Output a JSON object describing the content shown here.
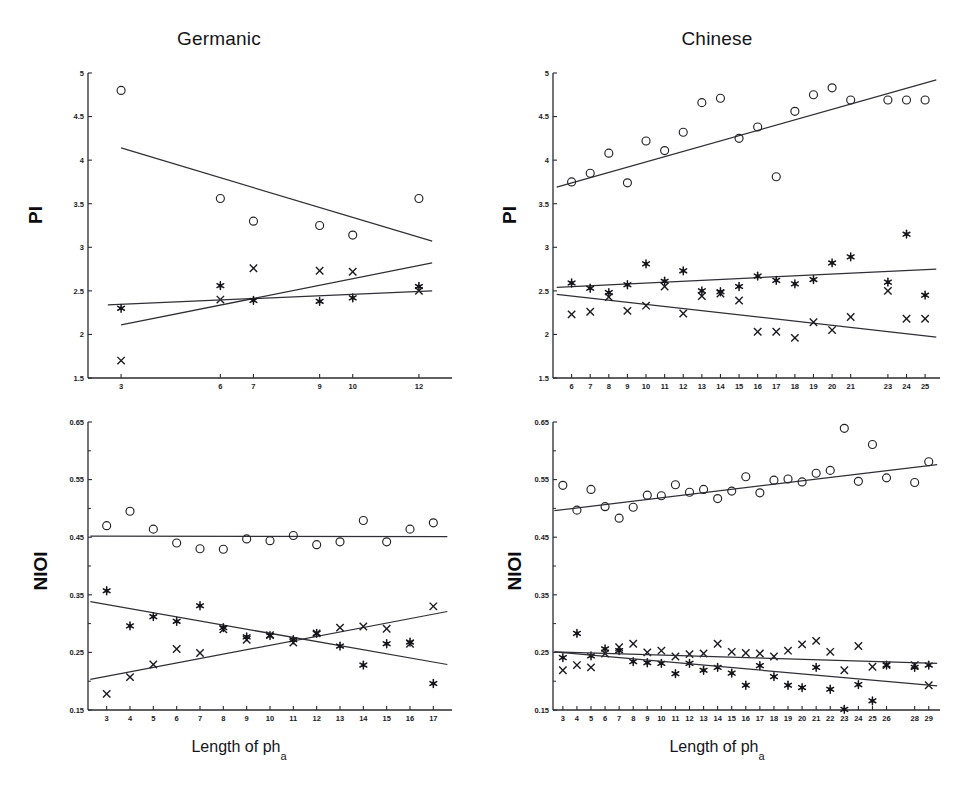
{
  "figure": {
    "xlabel_main": "Length of ph",
    "xlabel_sub": "a"
  },
  "panels": {
    "germanic_pi": {
      "title": "Germanic",
      "ylabel": "PI"
    },
    "chinese_pi": {
      "title": "Chinese",
      "ylabel": "PI"
    },
    "germanic_nioi": {
      "title": "",
      "ylabel": "NIOI"
    },
    "chinese_nioi": {
      "title": "",
      "ylabel": "NIOI"
    }
  },
  "chart_data": [
    {
      "id": "germanic_pi",
      "type": "scatter",
      "title": "Germanic",
      "xlabel": "Length of ph_a",
      "ylabel": "PI",
      "xlim": [
        2.0,
        13.0
      ],
      "ylim": [
        1.5,
        5.0
      ],
      "yticks": [
        1.5,
        2,
        2.5,
        3,
        3.5,
        4,
        4.5,
        5
      ],
      "ytick_labels": [
        "1.5",
        "2",
        "2.5",
        "3",
        "3.5",
        "4",
        "4.5",
        "5"
      ],
      "xticks": [
        3,
        6,
        7,
        9,
        10,
        12
      ],
      "xtick_labels": [
        "3",
        "6",
        "7",
        "9",
        "10",
        "12"
      ],
      "grid": false,
      "legend": "none",
      "series": [
        {
          "name": "circle",
          "marker": "open-circle",
          "x": [
            3,
            6,
            7,
            9,
            10,
            12
          ],
          "values": [
            4.8,
            3.56,
            3.3,
            3.25,
            3.14,
            3.56
          ],
          "fit": {
            "x": [
              3.0,
              12.4
            ],
            "y": [
              4.14,
              3.07
            ]
          }
        },
        {
          "name": "cross",
          "marker": "x-cross",
          "x": [
            3,
            6,
            7,
            9,
            10,
            12
          ],
          "values": [
            1.7,
            2.4,
            2.76,
            2.73,
            2.72,
            2.5
          ],
          "fit": {
            "x": [
              3.0,
              12.4
            ],
            "y": [
              2.11,
              2.82
            ]
          }
        },
        {
          "name": "asterisk",
          "marker": "filled-asterisk",
          "x": [
            3,
            6,
            7,
            9,
            10,
            12
          ],
          "values": [
            2.3,
            2.56,
            2.39,
            2.38,
            2.42,
            2.55
          ],
          "fit": {
            "x": [
              2.6,
              12.4
            ],
            "y": [
              2.34,
              2.5
            ]
          }
        }
      ]
    },
    {
      "id": "chinese_pi",
      "type": "scatter",
      "title": "Chinese",
      "xlabel": "Length of ph_a",
      "ylabel": "PI",
      "xlim": [
        5.0,
        25.8
      ],
      "ylim": [
        1.5,
        5.0
      ],
      "yticks": [
        1.5,
        2,
        2.5,
        3,
        3.5,
        4,
        4.5,
        5
      ],
      "ytick_labels": [
        "1.5",
        "2",
        "2.5",
        "3",
        "3.5",
        "4",
        "4.5",
        "5"
      ],
      "xticks": [
        6,
        7,
        8,
        9,
        10,
        11,
        12,
        13,
        14,
        15,
        16,
        17,
        18,
        19,
        20,
        21,
        23,
        24,
        25
      ],
      "xtick_labels": [
        "6",
        "7",
        "8",
        "9",
        "10",
        "11",
        "12",
        "13",
        "14",
        "15",
        "16",
        "17",
        "18",
        "19",
        "20",
        "21",
        "23",
        "24",
        "25"
      ],
      "grid": false,
      "legend": "none",
      "series": [
        {
          "name": "circle",
          "marker": "open-circle",
          "x": [
            6,
            7,
            8,
            9,
            10,
            11,
            12,
            13,
            14,
            15,
            16,
            17,
            18,
            19,
            20,
            21,
            23,
            24,
            25
          ],
          "values": [
            3.75,
            3.85,
            4.08,
            3.74,
            4.22,
            4.11,
            4.32,
            4.66,
            4.71,
            4.25,
            4.38,
            3.81,
            4.56,
            4.75,
            4.83,
            4.69,
            4.69,
            4.69,
            4.69
          ],
          "fit": {
            "x": [
              5.2,
              25.6
            ],
            "y": [
              3.69,
              4.92
            ]
          }
        },
        {
          "name": "cross",
          "marker": "x-cross",
          "x": [
            6,
            7,
            8,
            9,
            10,
            11,
            12,
            13,
            14,
            15,
            16,
            17,
            18,
            19,
            20,
            21,
            23,
            24,
            25
          ],
          "values": [
            2.23,
            2.26,
            2.43,
            2.27,
            2.33,
            2.55,
            2.24,
            2.44,
            2.47,
            2.39,
            2.03,
            2.03,
            1.96,
            2.14,
            2.05,
            2.2,
            2.5,
            2.18,
            2.18
          ],
          "fit": {
            "x": [
              5.2,
              25.6
            ],
            "y": [
              2.46,
              1.97
            ]
          }
        },
        {
          "name": "asterisk",
          "marker": "filled-asterisk",
          "x": [
            6,
            7,
            8,
            9,
            10,
            11,
            12,
            13,
            14,
            15,
            16,
            17,
            18,
            19,
            20,
            21,
            23,
            24,
            25
          ],
          "values": [
            2.59,
            2.53,
            2.48,
            2.57,
            2.81,
            2.61,
            2.73,
            2.5,
            2.49,
            2.55,
            2.67,
            2.62,
            2.58,
            2.63,
            2.82,
            2.89,
            2.6,
            3.15,
            2.45
          ],
          "fit": {
            "x": [
              5.2,
              25.6
            ],
            "y": [
              2.54,
              2.75
            ]
          }
        }
      ]
    },
    {
      "id": "germanic_nioi",
      "type": "scatter",
      "title": "Germanic",
      "xlabel": "Length of ph_a",
      "ylabel": "NIOI",
      "xlim": [
        2.2,
        17.8
      ],
      "ylim": [
        0.15,
        0.65
      ],
      "yticks": [
        0.15,
        0.25,
        0.35,
        0.45,
        0.55,
        0.65
      ],
      "ytick_labels": [
        "0.15",
        "0.25",
        "0.35",
        "0.45",
        "0.55",
        "0.65"
      ],
      "xticks": [
        3,
        4,
        5,
        6,
        7,
        8,
        9,
        10,
        11,
        12,
        13,
        14,
        15,
        16,
        17
      ],
      "xtick_labels": [
        "3",
        "4",
        "5",
        "6",
        "7",
        "8",
        "9",
        "10",
        "11",
        "12",
        "13",
        "14",
        "15",
        "16",
        "17"
      ],
      "grid": false,
      "legend": "none",
      "series": [
        {
          "name": "circle",
          "marker": "open-circle",
          "x": [
            3,
            4,
            5,
            6,
            7,
            8,
            9,
            10,
            11,
            12,
            13,
            14,
            15,
            16,
            17
          ],
          "values": [
            0.47,
            0.495,
            0.464,
            0.44,
            0.43,
            0.429,
            0.447,
            0.444,
            0.453,
            0.437,
            0.442,
            0.479,
            0.442,
            0.464,
            0.475
          ],
          "fit": {
            "x": [
              2.3,
              17.6
            ],
            "y": [
              0.452,
              0.451
            ]
          }
        },
        {
          "name": "cross",
          "marker": "x-cross",
          "x": [
            3,
            4,
            5,
            6,
            7,
            8,
            9,
            10,
            11,
            12,
            13,
            14,
            15,
            16,
            17
          ],
          "values": [
            0.178,
            0.207,
            0.229,
            0.256,
            0.249,
            0.29,
            0.272,
            0.28,
            0.267,
            0.283,
            0.293,
            0.295,
            0.291,
            0.265,
            0.33
          ],
          "fit": {
            "x": [
              2.3,
              17.6
            ],
            "y": [
              0.203,
              0.321
            ]
          }
        },
        {
          "name": "asterisk",
          "marker": "filled-asterisk",
          "x": [
            3,
            4,
            5,
            6,
            7,
            8,
            9,
            10,
            11,
            12,
            13,
            14,
            15,
            16,
            17
          ],
          "values": [
            0.357,
            0.296,
            0.312,
            0.304,
            0.331,
            0.293,
            0.277,
            0.279,
            0.272,
            0.283,
            0.261,
            0.228,
            0.265,
            0.268,
            0.196
          ],
          "fit": {
            "x": [
              2.3,
              17.6
            ],
            "y": [
              0.338,
              0.229
            ]
          }
        }
      ]
    },
    {
      "id": "chinese_nioi",
      "type": "scatter",
      "title": "Chinese",
      "xlabel": "Length of ph_a",
      "ylabel": "NIOI",
      "xlim": [
        2.3,
        29.8
      ],
      "ylim": [
        0.15,
        0.65
      ],
      "yticks": [
        0.15,
        0.25,
        0.35,
        0.45,
        0.55,
        0.65
      ],
      "ytick_labels": [
        "0.15",
        "0.25",
        "0.35",
        "0.45",
        "0.55",
        "0.65"
      ],
      "xticks": [
        3,
        4,
        5,
        6,
        7,
        8,
        9,
        10,
        11,
        12,
        13,
        14,
        15,
        16,
        17,
        18,
        19,
        20,
        21,
        22,
        23,
        24,
        25,
        26,
        28,
        29
      ],
      "xtick_labels": [
        "3",
        "4",
        "5",
        "6",
        "7",
        "8",
        "9",
        "10",
        "11",
        "12",
        "13",
        "14",
        "15",
        "16",
        "17",
        "18",
        "19",
        "20",
        "21",
        "22",
        "23",
        "24",
        "25",
        "26",
        "28",
        "29"
      ],
      "grid": false,
      "legend": "none",
      "series": [
        {
          "name": "circle",
          "marker": "open-circle",
          "x": [
            3,
            4,
            5,
            6,
            7,
            8,
            9,
            10,
            11,
            12,
            13,
            14,
            15,
            16,
            17,
            18,
            19,
            20,
            21,
            22,
            23,
            24,
            25,
            26,
            28,
            29
          ],
          "values": [
            0.54,
            0.497,
            0.533,
            0.503,
            0.483,
            0.502,
            0.523,
            0.522,
            0.541,
            0.528,
            0.533,
            0.517,
            0.53,
            0.555,
            0.527,
            0.549,
            0.551,
            0.546,
            0.561,
            0.566,
            0.639,
            0.547,
            0.611,
            0.553,
            0.545,
            0.581
          ],
          "fit": {
            "x": [
              2.4,
              29.6
            ],
            "y": [
              0.496,
              0.576
            ]
          }
        },
        {
          "name": "cross",
          "marker": "x-cross",
          "x": [
            3,
            4,
            5,
            6,
            7,
            8,
            9,
            10,
            11,
            12,
            13,
            14,
            15,
            16,
            17,
            18,
            19,
            20,
            21,
            22,
            23,
            24,
            25,
            26,
            28,
            29
          ],
          "values": [
            0.219,
            0.228,
            0.224,
            0.248,
            0.259,
            0.265,
            0.25,
            0.253,
            0.243,
            0.247,
            0.248,
            0.265,
            0.251,
            0.249,
            0.248,
            0.243,
            0.253,
            0.264,
            0.27,
            0.251,
            0.219,
            0.261,
            0.225,
            0.228,
            0.228,
            0.193
          ]
        },
        {
          "name": "asterisk",
          "marker": "filled-asterisk",
          "x": [
            3,
            4,
            5,
            6,
            7,
            8,
            9,
            10,
            11,
            12,
            13,
            14,
            15,
            16,
            17,
            18,
            19,
            20,
            21,
            22,
            23,
            24,
            25,
            26,
            28,
            29
          ],
          "values": [
            0.241,
            0.283,
            0.244,
            0.256,
            0.253,
            0.234,
            0.232,
            0.231,
            0.213,
            0.231,
            0.219,
            0.224,
            0.214,
            0.193,
            0.227,
            0.208,
            0.193,
            0.189,
            0.224,
            0.186,
            0.151,
            0.194,
            0.166,
            0.228,
            0.224,
            0.228
          ]
        }
      ],
      "fits_extra": [
        {
          "name": "cross-fit",
          "x": [
            2.4,
            29.6
          ],
          "y": [
            0.251,
            0.231
          ]
        },
        {
          "name": "asterisk-fit",
          "x": [
            2.4,
            29.6
          ],
          "y": [
            0.251,
            0.192
          ]
        }
      ]
    }
  ]
}
